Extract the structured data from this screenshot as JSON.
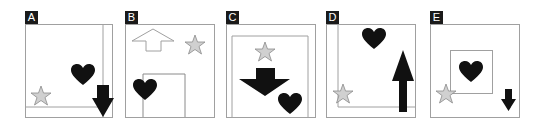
{
  "figure": {
    "panels": [
      {
        "label": "A",
        "items": [
          "frame-lines",
          "heart",
          "star",
          "down-arrow"
        ]
      },
      {
        "label": "B",
        "items": [
          "up-arrow-outline",
          "star",
          "heart",
          "inner-box"
        ]
      },
      {
        "label": "C",
        "items": [
          "inner-box",
          "star",
          "down-arrow-wide",
          "heart"
        ]
      },
      {
        "label": "D",
        "items": [
          "frame-lines",
          "heart",
          "up-arrow",
          "star"
        ]
      },
      {
        "label": "E",
        "items": [
          "inner-box",
          "heart",
          "star",
          "down-arrow"
        ]
      }
    ],
    "colors": {
      "label_bg": "#1a1a1a",
      "label_text": "#ffffff",
      "frame": "#a0a0a0",
      "solid_shape": "#111111",
      "star_fill": "#d0d0d0",
      "star_stroke": "#8a8a8a"
    }
  }
}
